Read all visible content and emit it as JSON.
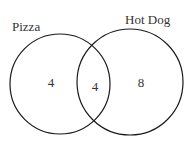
{
  "diagram": {
    "type": "venn",
    "sets": [
      {
        "label": "Pizza",
        "only_count": "4"
      },
      {
        "label": "Hot Dog",
        "only_count": "8"
      }
    ],
    "intersection_count": "4",
    "stroke_color": "#1a1a1a",
    "text_color": "#333333"
  }
}
